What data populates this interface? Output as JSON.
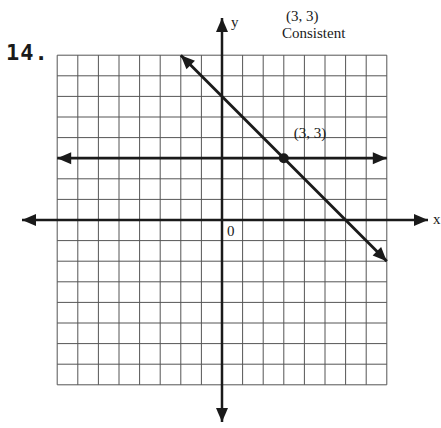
{
  "problem": {
    "number_label": "14.",
    "answer_point": "(3, 3)",
    "answer_type": "Consistent"
  },
  "chart_data": {
    "type": "line",
    "title": "",
    "xlabel": "x",
    "ylabel": "y",
    "origin_label": "0",
    "xlim": [
      -8,
      8
    ],
    "ylim": [
      -8,
      8
    ],
    "grid": true,
    "series": [
      {
        "name": "y = 3",
        "points": [
          [
            -8,
            3
          ],
          [
            8,
            3
          ]
        ]
      },
      {
        "name": "x + y = 6",
        "points": [
          [
            -2,
            8
          ],
          [
            8,
            -2
          ]
        ]
      }
    ],
    "annotations": [
      {
        "text": "(3, 3)",
        "x": 3,
        "y": 3,
        "marker": "dot"
      }
    ]
  },
  "colors": {
    "ink": "#1a1a1a",
    "grid": "#555555",
    "paper": "#ffffff"
  }
}
